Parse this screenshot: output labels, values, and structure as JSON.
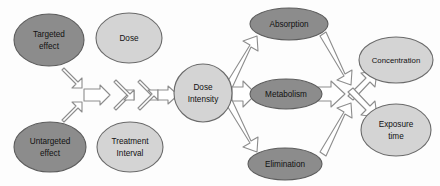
{
  "diagram": {
    "background_color": "#fdfdfd",
    "colors": {
      "dark_node_fill": "#8c8c8c",
      "light_node_fill": "#d4d4d4",
      "node_stroke": "#5a5a5a",
      "arrow_fill": "#ffffff",
      "arrow_stroke": "#8a8a8a",
      "label_text": "#111111"
    },
    "nodes": [
      {
        "id": "targeted-effect",
        "label_lines": [
          "Targeted",
          "effect"
        ],
        "shape": "ellipse",
        "cx": 49,
        "cy": 40,
        "rx": 35,
        "ry": 26,
        "style": "dark"
      },
      {
        "id": "dose",
        "label_lines": [
          "Dose"
        ],
        "shape": "ellipse",
        "cx": 129,
        "cy": 38,
        "rx": 33,
        "ry": 25,
        "style": "light"
      },
      {
        "id": "untargeted-effect",
        "label_lines": [
          "Untargeted",
          "effect"
        ],
        "shape": "ellipse",
        "cx": 50,
        "cy": 147,
        "rx": 36,
        "ry": 25,
        "style": "dark"
      },
      {
        "id": "treatment-interval",
        "label_lines": [
          "Treatment",
          "Interval"
        ],
        "shape": "ellipse",
        "cx": 130,
        "cy": 147,
        "rx": 33,
        "ry": 25,
        "style": "light"
      },
      {
        "id": "dose-intensity",
        "label_lines": [
          "Dose",
          "Intensity"
        ],
        "shape": "circle",
        "cx": 203,
        "cy": 93,
        "rx": 29,
        "ry": 29,
        "style": "light"
      },
      {
        "id": "absorption",
        "label_lines": [
          "Absorption"
        ],
        "shape": "ellipse",
        "cx": 289,
        "cy": 24,
        "rx": 39,
        "ry": 16,
        "style": "dark"
      },
      {
        "id": "metabolism",
        "label_lines": [
          "Metabolism"
        ],
        "shape": "ellipse",
        "cx": 286,
        "cy": 94,
        "rx": 36,
        "ry": 15,
        "style": "dark"
      },
      {
        "id": "elimination",
        "label_lines": [
          "Elimination"
        ],
        "shape": "ellipse",
        "cx": 285,
        "cy": 164,
        "rx": 37,
        "ry": 16,
        "style": "dark"
      },
      {
        "id": "concentration",
        "label_lines": [
          "Concentration"
        ],
        "shape": "ellipse",
        "cx": 396,
        "cy": 60,
        "rx": 37,
        "ry": 23,
        "style": "light"
      },
      {
        "id": "exposure-time",
        "label_lines": [
          "Exposure",
          "time"
        ],
        "shape": "ellipse",
        "cx": 396,
        "cy": 130,
        "rx": 35,
        "ry": 26,
        "style": "light"
      }
    ],
    "arrows": [
      {
        "id": "targeted-to-merge",
        "from": "targeted-effect",
        "to": "left-merge",
        "direction": "down-right"
      },
      {
        "id": "untargeted-to-merge",
        "from": "untargeted-effect",
        "to": "left-merge",
        "direction": "up-right"
      },
      {
        "id": "left-merge-to-hub",
        "from": "left-merge",
        "to": "center-hub",
        "direction": "right"
      },
      {
        "id": "hub-to-dose",
        "from": "center-hub",
        "to": "dose",
        "direction": "up-right"
      },
      {
        "id": "hub-to-treatment",
        "from": "center-hub",
        "to": "treatment-interval",
        "direction": "down-right"
      },
      {
        "id": "dose-to-hub2",
        "from": "dose",
        "to": "right-merge",
        "direction": "down-right"
      },
      {
        "id": "treatment-to-hub2",
        "from": "treatment-interval",
        "to": "right-merge",
        "direction": "up-right"
      },
      {
        "id": "right-merge-to-intensity",
        "from": "right-merge",
        "to": "dose-intensity",
        "direction": "right"
      },
      {
        "id": "intensity-to-absorption",
        "from": "dose-intensity",
        "to": "absorption",
        "direction": "up-right"
      },
      {
        "id": "intensity-to-metabolism",
        "from": "dose-intensity",
        "to": "metabolism",
        "direction": "right"
      },
      {
        "id": "intensity-to-elimination",
        "from": "dose-intensity",
        "to": "elimination",
        "direction": "down-right"
      },
      {
        "id": "absorption-to-junction",
        "from": "absorption",
        "to": "right-junction",
        "direction": "down-right"
      },
      {
        "id": "metabolism-to-junction",
        "from": "metabolism",
        "to": "right-junction",
        "direction": "right"
      },
      {
        "id": "elimination-to-junction",
        "from": "elimination",
        "to": "right-junction",
        "direction": "up-right"
      },
      {
        "id": "junction-to-concentration",
        "from": "right-junction",
        "to": "concentration",
        "direction": "up-right"
      },
      {
        "id": "junction-to-exposure",
        "from": "right-junction",
        "to": "exposure-time",
        "direction": "down-right"
      }
    ]
  }
}
